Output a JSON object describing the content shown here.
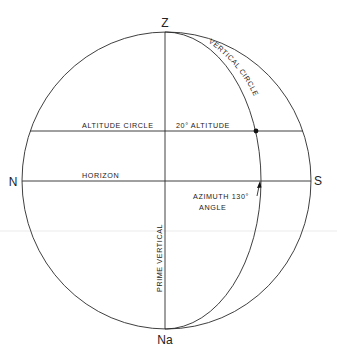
{
  "diagram": {
    "type": "celestial-horizon-coordinates",
    "points": {
      "zenith": "Z",
      "nadir": "Na",
      "north": "N",
      "south": "S"
    },
    "labels": {
      "vertical_circle": "VERTICAL CIRCLE",
      "altitude_circle": "ALTITUDE CIRCLE",
      "altitude_value": "20° ALTITUDE",
      "horizon": "HORIZON",
      "azimuth_line1": "AZIMUTH 130°",
      "azimuth_line2": "ANGLE",
      "prime_vertical": "PRIME VERTICAL"
    },
    "values": {
      "altitude_deg": 20,
      "azimuth_deg": 130
    },
    "colors": {
      "line": "#2a2a2a",
      "text": "#222222",
      "background": "#ffffff"
    }
  }
}
